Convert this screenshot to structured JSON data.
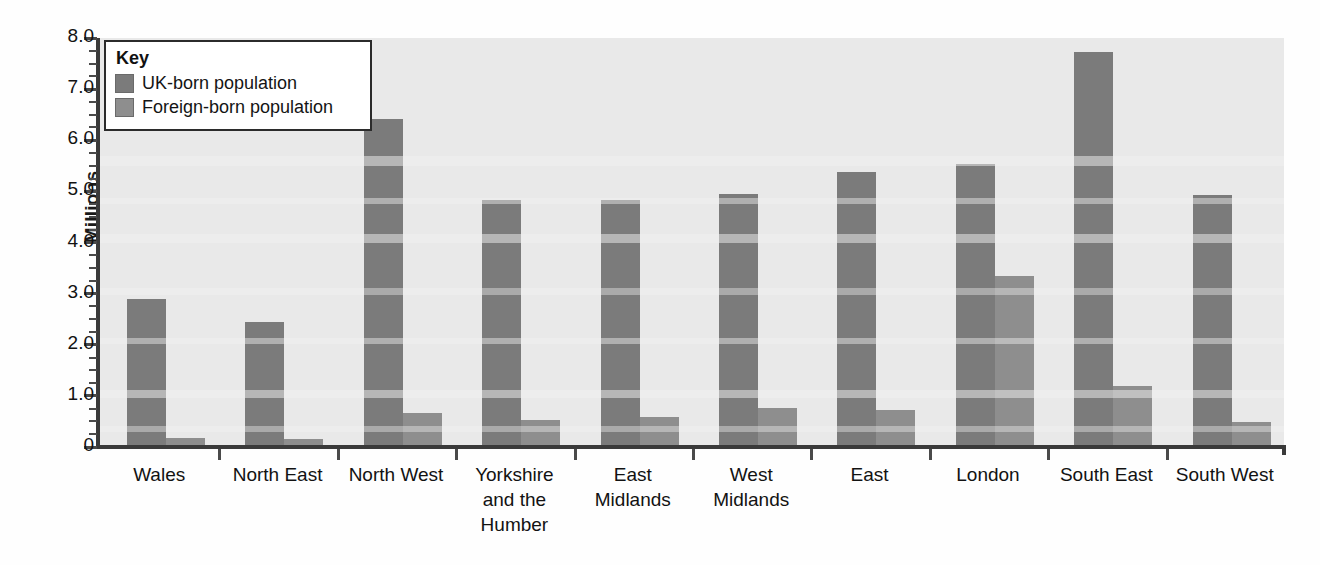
{
  "chart_data": {
    "type": "bar",
    "title": "",
    "xlabel": "",
    "ylabel": "Millions",
    "ylim": [
      0,
      8.0
    ],
    "ytick_labels": [
      "8.0",
      "7.0",
      "6.0",
      "5.0",
      "4.0",
      "3.0",
      "2.0",
      "1.0",
      "0"
    ],
    "ytick_values": [
      8.0,
      7.0,
      6.0,
      5.0,
      4.0,
      3.0,
      2.0,
      1.0,
      0
    ],
    "minor_tick_step": 0.25,
    "grid": false,
    "legend_position": "top-left",
    "legend_title": "Key",
    "categories": [
      "Wales",
      "North East",
      "North West",
      "Yorkshire and the Humber",
      "East Midlands",
      "West Midlands",
      "East",
      "London",
      "South East",
      "South West"
    ],
    "category_label_lines": [
      [
        "Wales"
      ],
      [
        "North East"
      ],
      [
        "North West"
      ],
      [
        "Yorkshire",
        "and the",
        "Humber"
      ],
      [
        "East",
        "Midlands"
      ],
      [
        "West",
        "Midlands"
      ],
      [
        "East"
      ],
      [
        "London"
      ],
      [
        "South East"
      ],
      [
        "South West"
      ]
    ],
    "series": [
      {
        "name": "UK-born population",
        "color": "#7b7b7b",
        "values": [
          2.9,
          2.45,
          6.42,
          4.84,
          4.84,
          4.95,
          5.37,
          5.53,
          7.73,
          4.92
        ]
      },
      {
        "name": "Foreign-born population",
        "color": "#8e8e8e",
        "values": [
          0.18,
          0.15,
          0.67,
          0.53,
          0.59,
          0.77,
          0.72,
          3.35,
          1.19,
          0.48
        ]
      }
    ]
  },
  "legend": {
    "title": "Key",
    "entries": [
      {
        "label": "UK-born population",
        "color": "#7b7b7b"
      },
      {
        "label": "Foreign-born population",
        "color": "#8e8e8e"
      }
    ]
  },
  "axis": {
    "y_title": "Millions"
  },
  "colors": {
    "plot_background": "#e9e9e9",
    "axis_line": "#3a3a3a",
    "uk_born": "#7b7b7b",
    "foreign_born": "#8e8e8e",
    "text": "#121212"
  }
}
